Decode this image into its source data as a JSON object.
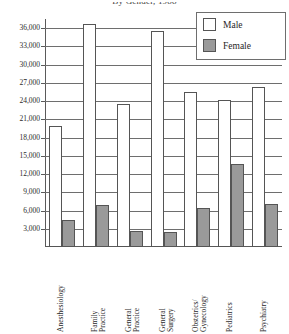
{
  "title": "By Gender, 1988",
  "legend": {
    "position": "top-right",
    "entries": [
      {
        "label": "Male",
        "swatch": "male-swatch",
        "color": "#ffffff"
      },
      {
        "label": "Female",
        "swatch": "female-swatch",
        "color": "#9a9a9a"
      }
    ]
  },
  "chart_data": {
    "type": "bar",
    "title": "By Gender, 1988",
    "xlabel": "",
    "ylabel": "",
    "ylim": [
      0,
      37500
    ],
    "ytick_step": 3000,
    "grid": true,
    "legend_position": "top-right",
    "categories": [
      "Anesthesiology",
      "Family\nPractice",
      "General\nPractice",
      "General\nSurgery",
      "Obstetrics/\nGynecology",
      "Pediatrics",
      "Psychiatry"
    ],
    "yticks": [
      "3,000",
      "6,000",
      "9,000",
      "12,000",
      "15,000",
      "18,000",
      "21,000",
      "24,000",
      "27,000",
      "30,000",
      "33,000",
      "36,000"
    ],
    "ytick_values": [
      3000,
      6000,
      9000,
      12000,
      15000,
      18000,
      21000,
      24000,
      27000,
      30000,
      33000,
      36000
    ],
    "series": [
      {
        "name": "Male",
        "color": "#ffffff",
        "values": [
          19900,
          36600,
          23500,
          35500,
          25500,
          24200,
          26400
        ]
      },
      {
        "name": "Female",
        "color": "#9a9a9a",
        "values": [
          4400,
          6900,
          2600,
          2500,
          6400,
          13600,
          7100
        ]
      }
    ]
  }
}
